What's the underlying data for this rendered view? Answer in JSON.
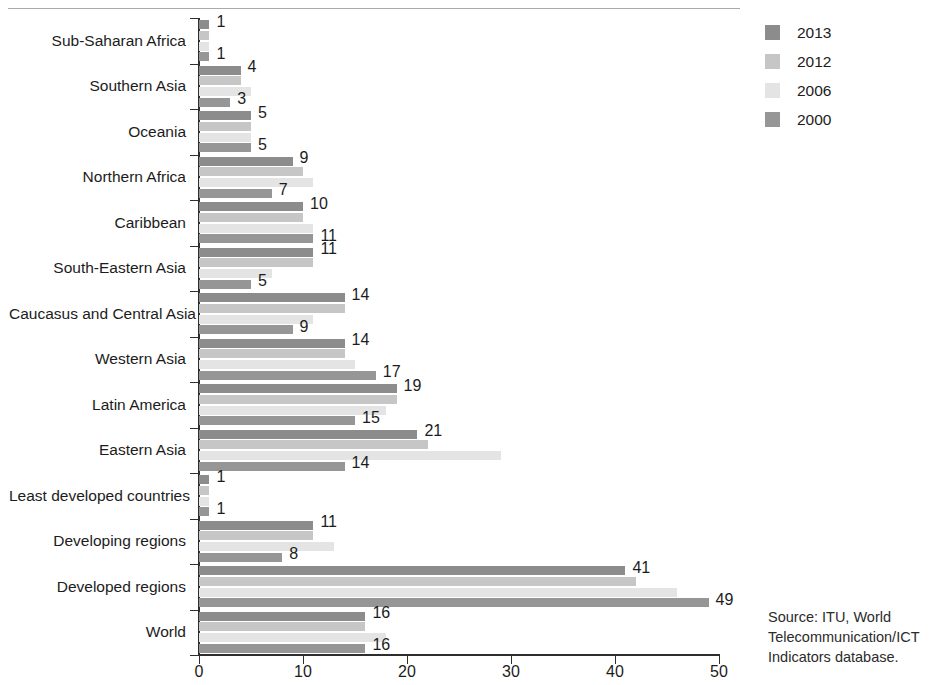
{
  "chart_data": {
    "type": "bar",
    "orientation": "horizontal",
    "title": "",
    "xlabel": "",
    "ylabel": "",
    "xlim": [
      0,
      50
    ],
    "xticks": [
      0,
      10,
      20,
      30,
      40,
      50
    ],
    "grid": false,
    "legend_position": "right-top",
    "categories": [
      "Sub-Saharan Africa",
      "Southern Asia",
      "Oceania",
      "Northern Africa",
      "Caribbean",
      "South-Eastern Asia",
      "Caucasus and Central Asia",
      "Western Asia",
      "Latin America",
      "Eastern Asia",
      "Least developed countries",
      "Developing regions",
      "Developed regions",
      "World"
    ],
    "series": [
      {
        "name": "2013",
        "color": "#8c8c8c",
        "labelled": true,
        "values": [
          1,
          4,
          5,
          9,
          10,
          11,
          14,
          14,
          19,
          21,
          1,
          11,
          41,
          16
        ]
      },
      {
        "name": "2012",
        "color": "#c6c6c6",
        "labelled": false,
        "values": [
          1,
          4,
          5,
          10,
          10,
          11,
          14,
          14,
          19,
          22,
          1,
          11,
          42,
          16
        ]
      },
      {
        "name": "2006",
        "color": "#e4e4e4",
        "labelled": false,
        "values": [
          1,
          5,
          5,
          11,
          11,
          7,
          11,
          15,
          18,
          29,
          1,
          13,
          46,
          18
        ]
      },
      {
        "name": "2000",
        "color": "#969696",
        "labelled": true,
        "values": [
          1,
          3,
          5,
          7,
          11,
          5,
          9,
          17,
          15,
          14,
          1,
          8,
          49,
          16
        ]
      }
    ]
  },
  "legend": {
    "items": [
      {
        "label": "2013",
        "color": "#8c8c8c"
      },
      {
        "label": "2012",
        "color": "#c6c6c6"
      },
      {
        "label": "2006",
        "color": "#e4e4e4"
      },
      {
        "label": "2000",
        "color": "#969696"
      }
    ]
  },
  "source": {
    "line1": "Source:  ITU, World",
    "line2": "Telecommunication/ICT",
    "line3": "Indicators database."
  }
}
